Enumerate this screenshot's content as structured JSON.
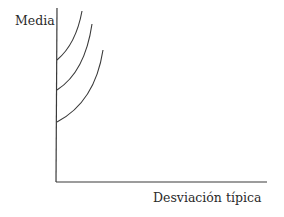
{
  "diagram": {
    "y_axis_label": "Media",
    "x_axis_label": "Desviación típica",
    "line_color": "#3a3a3a",
    "axes": {
      "origin": [
        56,
        182
      ],
      "y_top": [
        57,
        8
      ],
      "x_end": [
        267,
        182
      ]
    },
    "curves": [
      {
        "name": "curve-1",
        "start": [
          57,
          60
        ],
        "end": [
          82,
          11
        ]
      },
      {
        "name": "curve-2",
        "start": [
          57,
          90
        ],
        "end": [
          92,
          24
        ]
      },
      {
        "name": "curve-3",
        "start": [
          57,
          122
        ],
        "end": [
          103,
          50
        ]
      }
    ]
  }
}
